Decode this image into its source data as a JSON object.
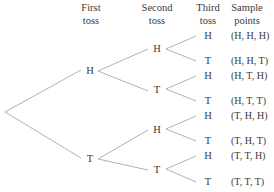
{
  "headers": {
    "first": [
      "First",
      "toss"
    ],
    "second": [
      "Second",
      "toss"
    ],
    "third": [
      "Third",
      "toss"
    ],
    "sample": [
      "Sample",
      "points"
    ]
  },
  "first_toss": [
    "H",
    "T"
  ],
  "second_toss": [
    "H",
    "T",
    "H",
    "T"
  ],
  "third_toss": [
    "H",
    "T",
    "H",
    "T",
    "H",
    "T",
    "H",
    "T"
  ],
  "sample_points": [
    "(H, H, H)",
    "(H, H, T)",
    "(H, T, H)",
    "(H, T, T)",
    "(T, H, H)",
    "(T, H, T)",
    "(T, T, H)",
    "(T, T, T)"
  ],
  "colors": {
    "line": "#a8a8a8",
    "text": "#3a3a3a"
  }
}
